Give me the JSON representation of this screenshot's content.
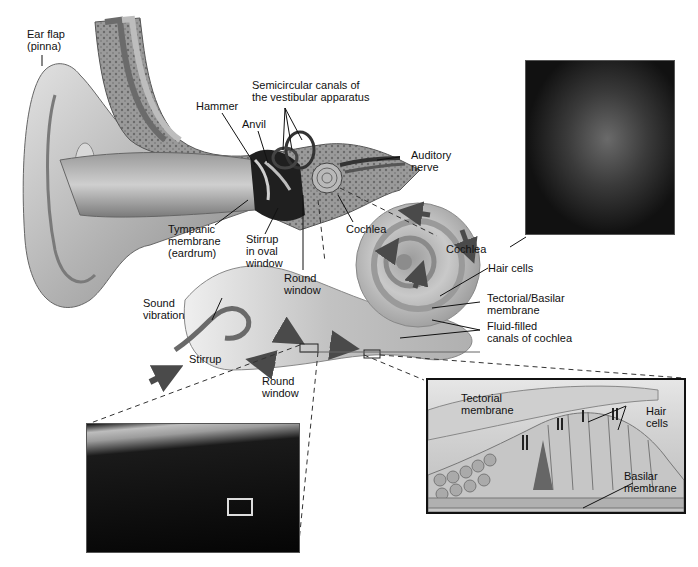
{
  "figure": {
    "labels": {
      "ear_flap": [
        "Ear flap",
        "(pinna)"
      ],
      "hammer": "Hammer",
      "anvil": "Anvil",
      "semicircular": [
        "Semicircular canals of",
        "the vestibular apparatus"
      ],
      "auditory_nerve": [
        "Auditory",
        "nerve"
      ],
      "tympanic": [
        "Tympanic",
        "membrane",
        "(eardrum)"
      ],
      "stirrup_oval": [
        "Stirrup",
        "in oval",
        "window"
      ],
      "round_window_top": [
        "Round",
        "window"
      ],
      "cochlea_top": "Cochlea",
      "cochlea_unrolled": "Cochlea",
      "hair_cells": "Hair cells",
      "tectorial_basilar": [
        "Tectorial/Basilar",
        "membrane"
      ],
      "fluid_filled": [
        "Fluid-filled",
        "canals of cochlea"
      ],
      "sound_vibration": [
        "Sound",
        "vibration"
      ],
      "stirrup": "Stirrup",
      "round_window_bottom": [
        "Round",
        "window"
      ],
      "inset_tectorial": [
        "Tectorial",
        "membrane"
      ],
      "inset_hair_cells": [
        "Hair",
        "cells"
      ],
      "inset_basilar": [
        "Basilar",
        "membrane"
      ]
    },
    "colors": {
      "ink": "#111111",
      "tissue_light": "#d8d8d8",
      "tissue_mid": "#a8a8a8",
      "tissue_dark": "#5a5a5a",
      "photo_bg": "#0b0b0b",
      "inset_bg": "#e9e9e9"
    }
  }
}
